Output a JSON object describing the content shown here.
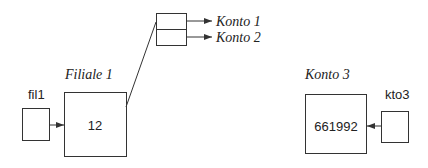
{
  "filiale": {
    "title": "Filiale 1",
    "value": "12",
    "pointer_label": "fil1"
  },
  "konto_array": {
    "items": [
      {
        "label": "Konto 1"
      },
      {
        "label": "Konto 2"
      }
    ]
  },
  "konto3": {
    "title": "Konto 3",
    "value": "661992",
    "pointer_label": "kto3"
  }
}
